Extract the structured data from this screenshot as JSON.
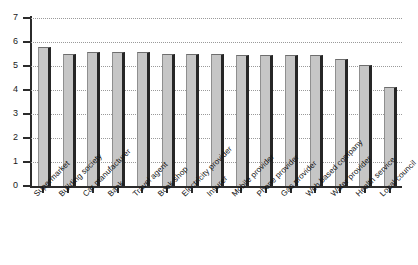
{
  "chart_data": {
    "type": "bar",
    "title": "",
    "subtitle": "",
    "xlabel": "",
    "ylabel": "",
    "ylim": [
      0,
      7
    ],
    "yticks": [
      0,
      1,
      2,
      3,
      4,
      5,
      6,
      7
    ],
    "ytick_labels": [
      "0",
      "1",
      "2",
      "3",
      "4",
      "5",
      "6",
      "7"
    ],
    "grid": true,
    "grid_axis": "y",
    "grid_style": "dotted",
    "legend": false,
    "legend_position": "none",
    "bar_fill_color": "#c6c6c6",
    "bar_edge_color": "#262626",
    "categories": [
      "Supermarket",
      "Building society",
      "Car manufacturer",
      "Bank",
      "Travel agent",
      "Book shop",
      "Electricity provider",
      "Insurer",
      "Mobile provider",
      "Phone provider",
      "Gas provider",
      "Web based company",
      "Water provider",
      "Health service",
      "Local council"
    ],
    "values": [
      5.8,
      5.52,
      5.58,
      5.58,
      5.58,
      5.52,
      5.52,
      5.52,
      5.44,
      5.44,
      5.44,
      5.44,
      5.3,
      5.03,
      4.12
    ]
  }
}
